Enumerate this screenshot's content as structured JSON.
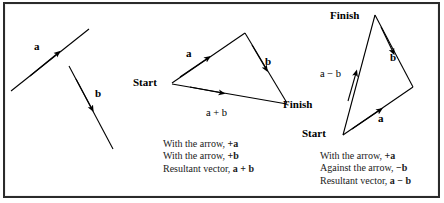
{
  "figure": {
    "background_color": "#ffffff",
    "frame_color": "#2b2b2b",
    "stroke_color": "#000000"
  },
  "panels": {
    "left": {
      "name": "given-vectors",
      "vectors": [
        {
          "label": "a",
          "from": [
            12,
            90
          ],
          "to": [
            88,
            30
          ],
          "arrow_at": [
            55,
            56
          ],
          "label_pos": [
            36,
            46
          ]
        },
        {
          "label": "b",
          "from": [
            70,
            68
          ],
          "to": [
            112,
            148
          ],
          "arrow_at": [
            92,
            110
          ],
          "label_pos": [
            96,
            92
          ]
        }
      ]
    },
    "middle": {
      "name": "vector-addition-triangle",
      "start_label": "Start",
      "finish_label": "Finish",
      "vector_a_label": "a",
      "vector_b_label": "b",
      "resultant_label": "a + b",
      "start_point": [
        172,
        83
      ],
      "apex_point": [
        244,
        33
      ],
      "finish_point": [
        286,
        102
      ],
      "caption": [
        {
          "text": "With the arrow, ",
          "emph": "+a"
        },
        {
          "text": "With the arrow, ",
          "emph": "+b"
        },
        {
          "text": "Resultant vector, ",
          "emph": "a + b"
        }
      ],
      "caption_lines": [
        "With the arrow, +a",
        "With the arrow, +b",
        "Resultant vector, a + b"
      ]
    },
    "right": {
      "name": "vector-subtraction-triangle",
      "start_label": "Start",
      "finish_label": "Finish",
      "vector_a_label": "a",
      "vector_b_label": "b",
      "resultant_label": "a − b",
      "start_point": [
        343,
        134
      ],
      "apex_point": [
        375,
        15
      ],
      "corner_point": [
        412,
        87
      ],
      "caption_lines": [
        "With the arrow, +a",
        "Against the arrow, −b",
        "Resultant vector, a − b"
      ]
    }
  },
  "captions": {
    "middle": {
      "line1_text": "With the arrow, ",
      "line1_emph": "+a",
      "line2_text": "With the arrow, ",
      "line2_emph": "+b",
      "line3_text": "Resultant vector, ",
      "line3_emph": "a + b"
    },
    "right": {
      "line1_text": "With the arrow, ",
      "line1_emph": "+a",
      "line2_text": "Against the arrow, ",
      "line2_emph": "−b",
      "line3_text": "Resultant vector, ",
      "line3_emph": "a − b"
    }
  }
}
